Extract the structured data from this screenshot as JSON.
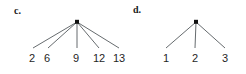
{
  "figure": {
    "background_color": "#ffffff",
    "edge_color": "#555a5e",
    "node_color": "#111111",
    "text_color": "#1f1f1f",
    "width": 246,
    "height": 74
  },
  "chart_data": {
    "type": "diagram",
    "subtype": "rooted-tree",
    "title": "",
    "panels": [
      {
        "id": "c",
        "label": "c.",
        "root": {
          "x": 77,
          "y": 22,
          "label": ""
        },
        "leaf_count": 5,
        "leaves": [
          {
            "label": "2",
            "x": 32,
            "y": 58,
            "edge_end_x": 33,
            "edge_end_y": 48
          },
          {
            "label": "6",
            "x": 47,
            "y": 58,
            "edge_end_x": 48,
            "edge_end_y": 48
          },
          {
            "label": "9",
            "x": 76,
            "y": 58,
            "edge_end_x": 77,
            "edge_end_y": 48
          },
          {
            "label": "12",
            "x": 99,
            "y": 58,
            "edge_end_x": 99,
            "edge_end_y": 48
          },
          {
            "label": "13",
            "x": 119,
            "y": 58,
            "edge_end_x": 119,
            "edge_end_y": 48
          }
        ]
      },
      {
        "id": "d",
        "label": "d.",
        "root": {
          "x": 60,
          "y": 22,
          "label": ""
        },
        "leaf_count": 3,
        "leaves": [
          {
            "label": "1",
            "x": 30,
            "y": 58,
            "edge_end_x": 30,
            "edge_end_y": 48
          },
          {
            "label": "2",
            "x": 59,
            "y": 58,
            "edge_end_x": 59,
            "edge_end_y": 48
          },
          {
            "label": "3",
            "x": 89,
            "y": 58,
            "edge_end_x": 89,
            "edge_end_y": 48
          }
        ]
      }
    ]
  }
}
